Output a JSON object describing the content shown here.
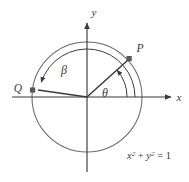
{
  "figure": {
    "type": "unit-circle-angle-diagram",
    "background_color": "#ffffff",
    "stroke_color": "#58565c",
    "line_color": "#3b3a3e",
    "axes": {
      "x_label": "x",
      "y_label": "y",
      "origin_px": [
        87,
        97
      ]
    },
    "circle": {
      "radius_px": 55,
      "equation_parts": {
        "x_var": "x",
        "x_exp": "2",
        "plus": " + ",
        "y_var": "y",
        "y_exp": "2",
        "equals": " = 1"
      },
      "equation_text": "x² + y² = 1"
    },
    "points": [
      {
        "name": "P",
        "label": "P",
        "angle_deg": 42,
        "marker": "square"
      },
      {
        "name": "Q",
        "label": "Q",
        "angle_deg": 172,
        "marker": "square"
      }
    ],
    "angles": [
      {
        "name": "theta",
        "label": "θ",
        "description": "angle from positive x-axis to ray OP"
      },
      {
        "name": "beta",
        "label": "β",
        "description": "angle from positive x-axis to ray OQ"
      }
    ]
  }
}
